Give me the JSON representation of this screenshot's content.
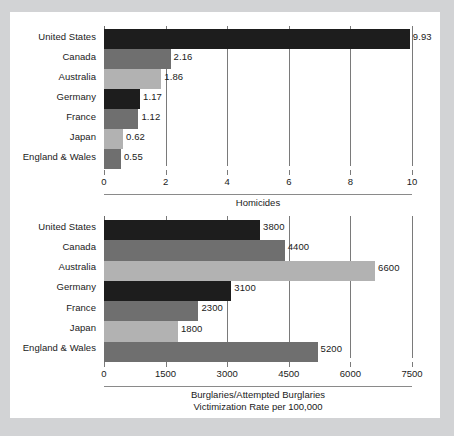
{
  "figure": {
    "background_color": "#d2d3d5",
    "page_color": "#ffffff",
    "series_colors": {
      "dark": "#1d1d1d",
      "medium": "#6f6f6f",
      "light": "#b2b2b2"
    }
  },
  "chart_data": [
    {
      "type": "bar",
      "orientation": "horizontal",
      "id": "homicides",
      "title": "",
      "xlabel": "Homicides",
      "ylabel": "",
      "xlim": [
        0,
        10
      ],
      "xticks": [
        0,
        2,
        4,
        6,
        8,
        10
      ],
      "xtick_labels": [
        "0",
        "2",
        "4",
        "6",
        "8",
        "10"
      ],
      "grid": true,
      "grid_axis": "x",
      "legend": false,
      "categories": [
        "United States",
        "Canada",
        "Australia",
        "Germany",
        "France",
        "Japan",
        "England & Wales"
      ],
      "values": [
        9.93,
        2.16,
        1.86,
        1.17,
        1.12,
        0.62,
        0.55
      ],
      "value_labels": [
        "9.93",
        "2.16",
        "1.86",
        "1.17",
        "1.12",
        "0.62",
        "0.55"
      ],
      "bar_shades": [
        "dark",
        "medium",
        "light",
        "dark",
        "medium",
        "light",
        "medium"
      ]
    },
    {
      "type": "bar",
      "orientation": "horizontal",
      "id": "burglaries",
      "title": "",
      "xlabel": "Burglaries/Attempted Burglaries",
      "xlabel_line2": "Victimization Rate per 100,000",
      "ylabel": "",
      "xlim": [
        0,
        7500
      ],
      "xticks": [
        0,
        1500,
        3000,
        4500,
        6000,
        7500
      ],
      "xtick_labels": [
        "0",
        "1500",
        "3000",
        "4500",
        "6000",
        "7500"
      ],
      "grid": true,
      "grid_axis": "x",
      "legend": false,
      "categories": [
        "United States",
        "Canada",
        "Australia",
        "Germany",
        "France",
        "Japan",
        "England & Wales"
      ],
      "values": [
        3800,
        4400,
        6600,
        3100,
        2300,
        1800,
        5200
      ],
      "value_labels": [
        "3800",
        "4400",
        "6600",
        "3100",
        "2300",
        "1800",
        "5200"
      ],
      "bar_shades": [
        "dark",
        "medium",
        "light",
        "dark",
        "medium",
        "light",
        "medium"
      ]
    }
  ]
}
